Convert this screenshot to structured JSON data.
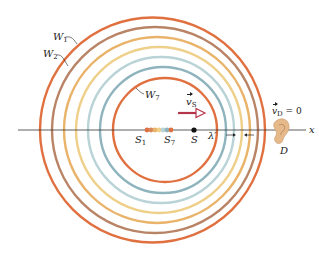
{
  "figure": {
    "axis_label": "x",
    "wavefronts": [
      {
        "id": "W1",
        "label": "W",
        "sub": "1",
        "cx": 152.5,
        "r": 112.5,
        "color": "#e0703f"
      },
      {
        "id": "W2",
        "label": "W",
        "sub": "2",
        "cx": 155,
        "r": 103,
        "color": "#b98466"
      },
      {
        "id": "W3",
        "cx": 157,
        "r": 93,
        "color": "#e9b36a"
      },
      {
        "id": "W4",
        "cx": 159,
        "r": 83,
        "color": "#efd08a"
      },
      {
        "id": "W5",
        "cx": 161,
        "r": 73,
        "color": "#b9d3d6"
      },
      {
        "id": "W6",
        "cx": 163,
        "r": 63,
        "color": "#8fb4bd"
      },
      {
        "id": "W7",
        "label": "W",
        "sub": "7",
        "cx": 165,
        "r": 52,
        "color": "#e0703f"
      }
    ],
    "source_positions": [
      {
        "x": 147,
        "color": "#e0703f"
      },
      {
        "x": 151,
        "color": "#d9855a"
      },
      {
        "x": 155,
        "color": "#e9b36a"
      },
      {
        "x": 159,
        "color": "#efd08a"
      },
      {
        "x": 163,
        "color": "#b9d3d6"
      },
      {
        "x": 167,
        "color": "#8fb4bd"
      },
      {
        "x": 171,
        "color": "#e0703f"
      }
    ],
    "labels": {
      "w1": {
        "main": "W",
        "sub": "1"
      },
      "w2": {
        "main": "W",
        "sub": "2"
      },
      "w7": {
        "main": "W",
        "sub": "7"
      },
      "s1": {
        "main": "S",
        "sub": "1"
      },
      "s7": {
        "main": "S",
        "sub": "7"
      },
      "s": "S",
      "vs": {
        "main": "v",
        "sub": "S"
      },
      "vd": {
        "main": "v",
        "sub": "D",
        "eq": " = 0"
      },
      "lambda": "λ′",
      "detector": "D",
      "x": "x"
    },
    "colors": {
      "axis": "#333333",
      "velocity_arrow": "#b5364a",
      "source": "#111111",
      "ear": "#e6b98a"
    }
  }
}
